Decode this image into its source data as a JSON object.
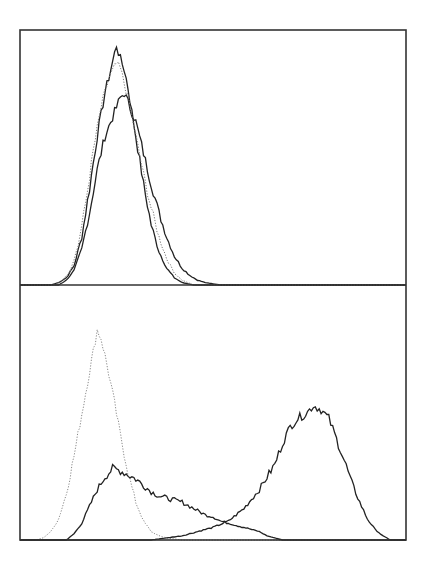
{
  "chart_data": [
    {
      "type": "line",
      "panel": "top",
      "title": "",
      "xlabel": "",
      "ylabel": "",
      "grid": false,
      "legend": null,
      "description": "Flow cytometry histogram overlay: two solid traces and one dotted trace, all unimodal and heavily overlapping",
      "x_range": [
        0,
        100
      ],
      "y_range": [
        0,
        100
      ],
      "series": [
        {
          "name": "solid-tall",
          "style": "solid",
          "color": "#222222",
          "points": [
            [
              0,
              0
            ],
            [
              8,
              0
            ],
            [
              10,
              1
            ],
            [
              12,
              3
            ],
            [
              14,
              8
            ],
            [
              16,
              20
            ],
            [
              18,
              40
            ],
            [
              20,
              62
            ],
            [
              22,
              80
            ],
            [
              24,
              93
            ],
            [
              25,
              100
            ],
            [
              26,
              94
            ],
            [
              27,
              90
            ],
            [
              28,
              82
            ],
            [
              30,
              62
            ],
            [
              32,
              42
            ],
            [
              34,
              25
            ],
            [
              36,
              14
            ],
            [
              38,
              7
            ],
            [
              40,
              3
            ],
            [
              42,
              1
            ],
            [
              45,
              0
            ],
            [
              100,
              0
            ]
          ]
        },
        {
          "name": "solid-shifted",
          "style": "solid",
          "color": "#222222",
          "points": [
            [
              0,
              0
            ],
            [
              10,
              0
            ],
            [
              12,
              2
            ],
            [
              14,
              6
            ],
            [
              16,
              15
            ],
            [
              18,
              30
            ],
            [
              20,
              48
            ],
            [
              22,
              62
            ],
            [
              24,
              70
            ],
            [
              26,
              78
            ],
            [
              27,
              80
            ],
            [
              28,
              76
            ],
            [
              30,
              68
            ],
            [
              32,
              55
            ],
            [
              34,
              42
            ],
            [
              36,
              30
            ],
            [
              38,
              20
            ],
            [
              40,
              12
            ],
            [
              42,
              7
            ],
            [
              44,
              4
            ],
            [
              46,
              2
            ],
            [
              48,
              1
            ],
            [
              52,
              0
            ],
            [
              100,
              0
            ]
          ]
        },
        {
          "name": "dotted-isotype",
          "style": "dotted",
          "color": "#777777",
          "points": [
            [
              0,
              0
            ],
            [
              9,
              0
            ],
            [
              11,
              2
            ],
            [
              13,
              6
            ],
            [
              15,
              16
            ],
            [
              17,
              34
            ],
            [
              19,
              56
            ],
            [
              21,
              74
            ],
            [
              23,
              86
            ],
            [
              25,
              92
            ],
            [
              26,
              90
            ],
            [
              28,
              78
            ],
            [
              30,
              62
            ],
            [
              32,
              46
            ],
            [
              34,
              32
            ],
            [
              36,
              20
            ],
            [
              38,
              11
            ],
            [
              40,
              5
            ],
            [
              42,
              2
            ],
            [
              45,
              0
            ],
            [
              100,
              0
            ]
          ]
        }
      ]
    },
    {
      "type": "line",
      "panel": "bottom",
      "title": "",
      "xlabel": "",
      "ylabel": "",
      "grid": false,
      "legend": null,
      "description": "Flow cytometry histogram overlay: dotted isotype peak at low intensity, broad solid curve with a long tail, and a solid high-intensity peak",
      "x_range": [
        0,
        100
      ],
      "y_range": [
        0,
        100
      ],
      "series": [
        {
          "name": "dotted-isotype",
          "style": "dotted",
          "color": "#888888",
          "points": [
            [
              0,
              0
            ],
            [
              4,
              0
            ],
            [
              6,
              1
            ],
            [
              8,
              4
            ],
            [
              10,
              10
            ],
            [
              12,
              22
            ],
            [
              14,
              40
            ],
            [
              16,
              60
            ],
            [
              18,
              80
            ],
            [
              19,
              90
            ],
            [
              20,
              100
            ],
            [
              21,
              96
            ],
            [
              22,
              88
            ],
            [
              24,
              70
            ],
            [
              26,
              50
            ],
            [
              28,
              32
            ],
            [
              30,
              18
            ],
            [
              32,
              9
            ],
            [
              34,
              4
            ],
            [
              36,
              2
            ],
            [
              38,
              1
            ],
            [
              42,
              0
            ],
            [
              100,
              0
            ]
          ]
        },
        {
          "name": "solid-broad",
          "style": "solid",
          "color": "#222222",
          "points": [
            [
              0,
              0
            ],
            [
              12,
              0
            ],
            [
              14,
              3
            ],
            [
              16,
              8
            ],
            [
              18,
              16
            ],
            [
              20,
              24
            ],
            [
              22,
              30
            ],
            [
              24,
              34
            ],
            [
              26,
              33
            ],
            [
              28,
              31
            ],
            [
              30,
              29
            ],
            [
              32,
              26
            ],
            [
              34,
              23
            ],
            [
              36,
              21
            ],
            [
              38,
              20
            ],
            [
              40,
              19
            ],
            [
              42,
              18
            ],
            [
              44,
              16
            ],
            [
              46,
              14
            ],
            [
              48,
              12
            ],
            [
              50,
              11
            ],
            [
              52,
              9
            ],
            [
              54,
              8
            ],
            [
              56,
              7
            ],
            [
              58,
              6
            ],
            [
              60,
              5
            ],
            [
              62,
              4
            ],
            [
              64,
              2
            ],
            [
              66,
              1
            ],
            [
              68,
              0
            ],
            [
              100,
              0
            ]
          ]
        },
        {
          "name": "solid-high",
          "style": "solid",
          "color": "#222222",
          "points": [
            [
              0,
              0
            ],
            [
              34,
              0
            ],
            [
              38,
              1
            ],
            [
              42,
              2
            ],
            [
              46,
              4
            ],
            [
              50,
              6
            ],
            [
              54,
              9
            ],
            [
              58,
              15
            ],
            [
              62,
              24
            ],
            [
              66,
              36
            ],
            [
              68,
              46
            ],
            [
              70,
              54
            ],
            [
              72,
              58
            ],
            [
              74,
              60
            ],
            [
              76,
              64
            ],
            [
              78,
              62
            ],
            [
              80,
              58
            ],
            [
              82,
              48
            ],
            [
              84,
              38
            ],
            [
              86,
              27
            ],
            [
              88,
              18
            ],
            [
              90,
              10
            ],
            [
              92,
              5
            ],
            [
              94,
              2
            ],
            [
              96,
              0
            ],
            [
              100,
              0
            ]
          ]
        }
      ]
    }
  ]
}
